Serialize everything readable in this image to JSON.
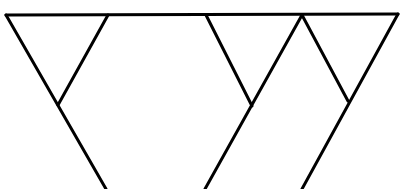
{
  "diagram": {
    "type": "line-drawing",
    "stroke_color": "#000000",
    "background_color": "#ffffff",
    "stroke_width": 3,
    "lines": [
      {
        "id": "top-bar",
        "x1": 6,
        "y1": 15,
        "x2": 398,
        "y2": 14
      },
      {
        "id": "left-trunk",
        "x1": 6,
        "y1": 15,
        "x2": 106,
        "y2": 189
      },
      {
        "id": "left-branch",
        "x1": 108,
        "y1": 15,
        "x2": 58,
        "y2": 105
      },
      {
        "id": "middle-trunk",
        "x1": 302,
        "y1": 15,
        "x2": 205,
        "y2": 189
      },
      {
        "id": "middle-branch",
        "x1": 206,
        "y1": 15,
        "x2": 252,
        "y2": 106
      },
      {
        "id": "right-trunk",
        "x1": 398,
        "y1": 14,
        "x2": 302,
        "y2": 189
      },
      {
        "id": "right-branch",
        "x1": 302,
        "y1": 15,
        "x2": 348,
        "y2": 101
      }
    ]
  }
}
